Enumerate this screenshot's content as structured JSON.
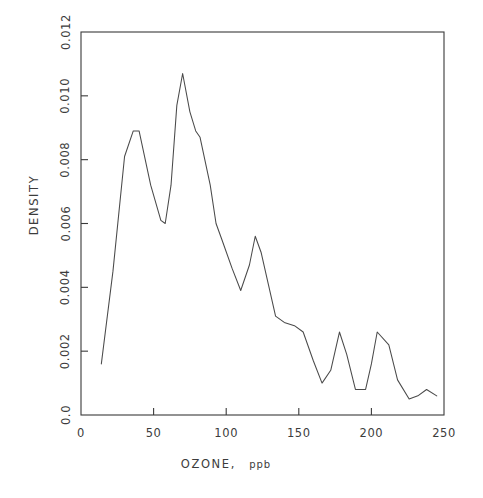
{
  "chart_data": {
    "type": "line",
    "title": "",
    "subtitle": "",
    "xlabel": "OZONE, ppb",
    "ylabel": "DENSITY",
    "xlim": [
      0,
      250
    ],
    "ylim": [
      0.0,
      0.012
    ],
    "grid": false,
    "legend": null,
    "x_ticks": [
      0,
      50,
      100,
      150,
      200,
      250
    ],
    "x_tick_labels": [
      "0",
      "50",
      "100",
      "150",
      "200",
      "250"
    ],
    "y_ticks": [
      0.0,
      0.002,
      0.004,
      0.006,
      0.008,
      0.01,
      0.012
    ],
    "y_tick_labels": [
      "0.0",
      "0.002",
      "0.004",
      "0.006",
      "0.008",
      "0.010",
      "0.012"
    ],
    "series": [
      {
        "name": "density",
        "x": [
          14,
          22,
          30,
          36,
          40,
          48,
          55,
          58,
          62,
          66,
          70,
          75,
          79,
          82,
          89,
          93,
          97,
          104,
          110,
          116,
          120,
          124,
          129,
          134,
          140,
          147,
          153,
          160,
          166,
          172,
          178,
          183,
          189,
          196,
          200,
          204,
          212,
          218,
          226,
          232,
          238,
          245
        ],
        "y": [
          0.0016,
          0.0045,
          0.0081,
          0.0089,
          0.0089,
          0.0072,
          0.0061,
          0.006,
          0.0072,
          0.0097,
          0.0107,
          0.0095,
          0.0089,
          0.0087,
          0.0072,
          0.006,
          0.0055,
          0.0046,
          0.0039,
          0.0047,
          0.0056,
          0.0051,
          0.0041,
          0.0031,
          0.0029,
          0.0028,
          0.0026,
          0.0017,
          0.001,
          0.0014,
          0.0026,
          0.0019,
          0.0008,
          0.0008,
          0.0016,
          0.0026,
          0.0022,
          0.0011,
          0.0005,
          0.0006,
          0.0008,
          0.0006
        ]
      }
    ]
  },
  "axes": {
    "y_label_text": "DENSITY",
    "x_label_main": "OZONE,",
    "x_label_unit": "ppb"
  }
}
